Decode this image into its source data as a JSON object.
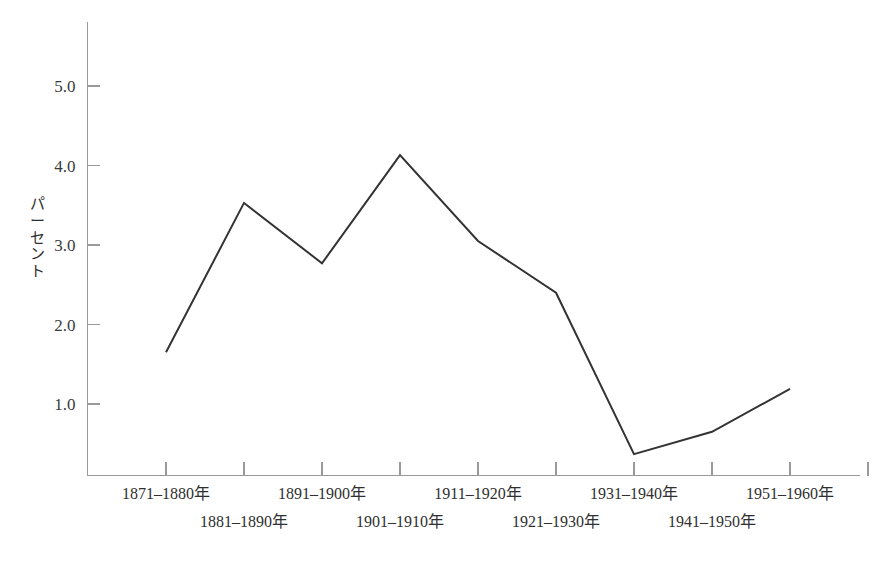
{
  "chart_data": {
    "type": "line",
    "title": "",
    "subtitle": "",
    "xlabel": "",
    "ylabel": "パーセント",
    "categories": [
      "1871–1880年",
      "1881–1890年",
      "1891–1900年",
      "1901–1910年",
      "1911–1920年",
      "1921–1930年",
      "1931–1940年",
      "1941–1950年",
      "1951–1960年"
    ],
    "values": [
      1.65,
      3.53,
      2.77,
      4.13,
      3.05,
      2.4,
      0.37,
      0.65,
      1.19
    ],
    "series": [
      {
        "name": "パーセント",
        "values": [
          1.65,
          3.53,
          2.77,
          4.13,
          3.05,
          2.4,
          0.37,
          0.65,
          1.19
        ]
      }
    ],
    "ylim": [
      0.0,
      5.7
    ],
    "ytick_labels": [
      "1.0",
      "2.0",
      "3.0",
      "4.0",
      "5.0"
    ],
    "ytick_values": [
      1.0,
      2.0,
      3.0,
      4.0,
      5.0
    ],
    "grid": false,
    "legend": false,
    "legend_position": "none",
    "line_color": "#333333",
    "axis_color": "#9a9a9a",
    "background_color": "#ffffff"
  },
  "yaxis": {
    "label_chars": [
      "パ",
      "ー",
      "セ",
      "ン",
      "ト"
    ]
  }
}
